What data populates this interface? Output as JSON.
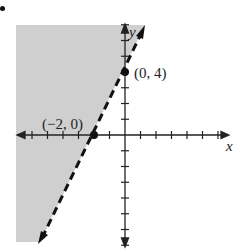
{
  "chart_data": {
    "type": "line",
    "title": "",
    "xlabel": "x",
    "ylabel": "y",
    "xlim": [
      -7,
      7
    ],
    "ylim": [
      -8,
      8
    ],
    "grid": false,
    "boundary_line": {
      "equation": "y = 2x + 4",
      "style": "dashed",
      "points": [
        [
          -2,
          0
        ],
        [
          0,
          4
        ]
      ]
    },
    "shaded_region": "y > 2x + 4 (left of line)",
    "labeled_points": [
      {
        "label": "(0, 4)",
        "x": 0,
        "y": 4
      },
      {
        "label": "(−2, 0)",
        "x": -2,
        "y": 0
      }
    ],
    "x_ticks": [
      -6,
      -5,
      -4,
      -3,
      -2,
      -1,
      1,
      2,
      3,
      4,
      5,
      6
    ],
    "y_ticks": [
      -7,
      -6,
      -5,
      -4,
      -3,
      -2,
      -1,
      1,
      2,
      3,
      4,
      5,
      6,
      7
    ]
  },
  "labels": {
    "x_axis": "x",
    "y_axis": "y",
    "point_a": "(0, 4)",
    "point_b": "(−2, 0)"
  },
  "colors": {
    "shade": "#cfcfcf",
    "line": "#111111"
  }
}
